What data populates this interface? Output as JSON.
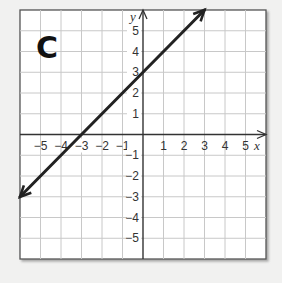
{
  "panel_label": "C",
  "chart_data": {
    "type": "line",
    "title": "C",
    "xlabel": "x",
    "ylabel": "y",
    "xlim": [
      -6,
      6
    ],
    "ylim": [
      -6,
      6
    ],
    "grid": true,
    "x_ticks": [
      -5,
      -4,
      -3,
      -2,
      -1,
      1,
      2,
      3,
      4,
      5
    ],
    "y_ticks": [
      5,
      4,
      3,
      2,
      1,
      -1,
      -2,
      -3,
      -4,
      -5
    ],
    "x_tick_labels": [
      "−5",
      "−4",
      "−3",
      "−2",
      "−1",
      "1",
      "2",
      "3",
      "4",
      "5"
    ],
    "y_tick_labels": [
      "5",
      "4",
      "3",
      "2",
      "1",
      "−1",
      "−2",
      "−3",
      "−4",
      "−5"
    ],
    "series": [
      {
        "name": "line",
        "equation": "y = x + 3",
        "slope": 1,
        "y_intercept": 3,
        "x_intercept": -3,
        "points": [
          [
            -6,
            -3
          ],
          [
            -3,
            0
          ],
          [
            0,
            3
          ],
          [
            3,
            6
          ]
        ],
        "arrows": "both ends",
        "color": "#222222"
      }
    ]
  },
  "colors": {
    "background": "#f1f1f0",
    "grid_bg": "#ffffff",
    "grid_line": "#c8c8c8",
    "axis": "#333333",
    "frame": "#555555",
    "line": "#222222"
  }
}
